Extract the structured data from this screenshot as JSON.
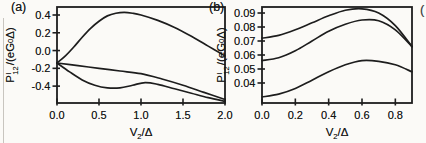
{
  "figure": {
    "panel_a_tag": "(a)",
    "panel_b_tag": "(b)",
    "edge_artifact": "("
  },
  "axis_labels": {
    "y": {
      "base": "P",
      "sup": "I",
      "sub": "12",
      "mid": "/(eG",
      "sub2": "0",
      "end": "Δ)"
    },
    "x": {
      "base": "V",
      "sub": "2",
      "rest": "/Δ"
    }
  },
  "line_color": "#1d1d1d",
  "chart_data": [
    {
      "type": "line",
      "panel": "a",
      "title": "",
      "xlabel": "V2/Δ",
      "ylabel": "P^I_12/(eG0Δ)",
      "xlim": [
        0,
        2.0
      ],
      "ylim": [
        -0.59,
        0.49
      ],
      "grid": false,
      "legend": null,
      "xticks": [
        0,
        0.5,
        1.0,
        1.5,
        2.0
      ],
      "xtick_labels": [
        "0.0",
        "0.5",
        "1.0",
        "1.5",
        "2.0"
      ],
      "yticks": [
        0.4,
        0.2,
        0.0,
        -0.2,
        -0.4
      ],
      "ytick_labels": [
        "0.4",
        "0.2",
        "0.0",
        "-0.2",
        "-0.4"
      ],
      "series": [
        {
          "name": "upper-hump",
          "x": [
            0,
            0.1,
            0.2,
            0.3,
            0.4,
            0.5,
            0.6,
            0.7,
            0.8,
            0.9,
            1.0,
            1.2,
            1.4,
            1.6,
            1.8,
            2.0
          ],
          "y": [
            -0.14,
            -0.06,
            0.04,
            0.15,
            0.25,
            0.33,
            0.39,
            0.42,
            0.43,
            0.42,
            0.4,
            0.34,
            0.26,
            0.16,
            0.05,
            -0.06
          ]
        },
        {
          "name": "middle-decline",
          "x": [
            0,
            0.25,
            0.5,
            0.75,
            1.0,
            1.25,
            1.5,
            1.75,
            2.0
          ],
          "y": [
            -0.14,
            -0.17,
            -0.2,
            -0.23,
            -0.26,
            -0.32,
            -0.39,
            -0.47,
            -0.55
          ]
        },
        {
          "name": "lower-dip-bump",
          "x": [
            0,
            0.15,
            0.3,
            0.45,
            0.6,
            0.75,
            0.9,
            1.05,
            1.2,
            1.4,
            1.6,
            1.8,
            2.0
          ],
          "y": [
            -0.14,
            -0.24,
            -0.33,
            -0.39,
            -0.42,
            -0.42,
            -0.39,
            -0.36,
            -0.38,
            -0.43,
            -0.48,
            -0.53,
            -0.57
          ]
        }
      ]
    },
    {
      "type": "line",
      "panel": "b",
      "title": "",
      "xlabel": "V2/Δ",
      "ylabel": "P^I_12/(eG0Δ)",
      "xlim": [
        0,
        0.9
      ],
      "ylim": [
        0.0257,
        0.0943
      ],
      "grid": false,
      "legend": null,
      "xticks": [
        0,
        0.2,
        0.4,
        0.6,
        0.8
      ],
      "xtick_labels": [
        "0.0",
        "0.2",
        "0.4",
        "0.6",
        "0.8"
      ],
      "yticks": [
        0.09,
        0.08,
        0.07,
        0.06,
        0.05,
        0.04
      ],
      "ytick_labels": [
        "0.09",
        "0.08",
        "0.07",
        "0.06",
        "0.05",
        "0.04"
      ],
      "series": [
        {
          "name": "top",
          "x": [
            0,
            0.1,
            0.2,
            0.3,
            0.4,
            0.5,
            0.6,
            0.7,
            0.8,
            0.9
          ],
          "y": [
            0.072,
            0.074,
            0.078,
            0.083,
            0.088,
            0.092,
            0.093,
            0.09,
            0.081,
            0.066
          ]
        },
        {
          "name": "middle",
          "x": [
            0,
            0.1,
            0.2,
            0.3,
            0.4,
            0.5,
            0.6,
            0.7,
            0.8,
            0.9
          ],
          "y": [
            0.056,
            0.058,
            0.063,
            0.07,
            0.077,
            0.082,
            0.085,
            0.0845,
            0.078,
            0.066
          ]
        },
        {
          "name": "bottom",
          "x": [
            0,
            0.1,
            0.2,
            0.3,
            0.4,
            0.5,
            0.6,
            0.7,
            0.8,
            0.9
          ],
          "y": [
            0.03,
            0.032,
            0.036,
            0.042,
            0.048,
            0.053,
            0.056,
            0.0555,
            0.053,
            0.048
          ]
        }
      ]
    }
  ]
}
